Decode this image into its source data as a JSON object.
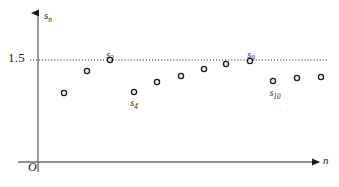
{
  "figure": {
    "background_color": "#ffffff",
    "ink_color": "#1b1b1b",
    "width": 339,
    "height": 187
  },
  "axes": {
    "y_axis_label": "s",
    "y_axis_label_sub": "n",
    "x_axis_label": "n",
    "origin_label": "O",
    "y_tick_label": "1.5",
    "y_axis_x_px": 38,
    "x_axis_y_px": 162,
    "y_axis_top_px": 11,
    "x_axis_right_px": 321
  },
  "guide_line": {
    "name": "limit-line",
    "value": 1.5,
    "style": "dotted",
    "y_px": 60,
    "x_start_px": 30,
    "x_end_px": 327
  },
  "chart_data": {
    "type": "scatter",
    "title": "",
    "xlabel": "n",
    "ylabel": "s_n",
    "grid": false,
    "legend": null,
    "annotations": [
      {
        "text": "s",
        "sub": "3",
        "for_index": 2,
        "x_px": 110,
        "y_px": 50
      },
      {
        "text": "s",
        "sub": "4",
        "for_index": 3,
        "x_px": 134,
        "y_px": 98
      },
      {
        "text": "s",
        "sub": "9",
        "for_index": 8,
        "x_px": 251,
        "y_px": 50
      },
      {
        "text": "s",
        "sub": "10",
        "for_index": 9,
        "x_px": 275,
        "y_px": 88
      }
    ],
    "reference_lines": [
      {
        "label": "1.5",
        "y_value": 1.5,
        "style": "dotted"
      }
    ],
    "x": [
      1,
      2,
      3,
      4,
      5,
      6,
      7,
      8,
      9,
      10,
      11,
      12
    ],
    "y": [
      1.28,
      1.42,
      1.5,
      1.29,
      1.36,
      1.4,
      1.44,
      1.47,
      1.49,
      1.37,
      1.39,
      1.4
    ],
    "points_px": [
      {
        "n": 1,
        "x": 64,
        "y": 93
      },
      {
        "n": 2,
        "x": 87,
        "y": 71
      },
      {
        "n": 3,
        "x": 110,
        "y": 60
      },
      {
        "n": 4,
        "x": 134,
        "y": 92
      },
      {
        "n": 5,
        "x": 157,
        "y": 82
      },
      {
        "n": 6,
        "x": 181,
        "y": 76
      },
      {
        "n": 7,
        "x": 204,
        "y": 69
      },
      {
        "n": 8,
        "x": 226,
        "y": 64
      },
      {
        "n": 9,
        "x": 250,
        "y": 61
      },
      {
        "n": 10,
        "x": 273,
        "y": 81
      },
      {
        "n": 11,
        "x": 297,
        "y": 78
      },
      {
        "n": 12,
        "x": 321,
        "y": 77
      }
    ],
    "marker": {
      "shape": "circle",
      "radius_px": 2.6,
      "fill": "#f2f2f2",
      "stroke": "#1b1b1b"
    }
  }
}
